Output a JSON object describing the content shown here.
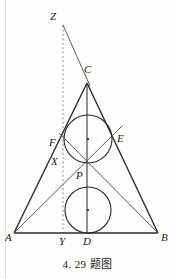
{
  "figure": {
    "caption": "4. 29 题图",
    "width": 175,
    "height": 279,
    "background_color": "#fdfdfb",
    "stroke_color": "#2b2b2b",
    "dashed_color": "#8a8a8a",
    "points": {
      "A": {
        "label": "A",
        "x": 14,
        "y": 233,
        "label_x": 5,
        "label_y": 232
      },
      "B": {
        "label": "B",
        "x": 158,
        "y": 233,
        "label_x": 161,
        "label_y": 232
      },
      "C": {
        "label": "C",
        "x": 87,
        "y": 83,
        "label_x": 84,
        "label_y": 64
      },
      "D": {
        "label": "D",
        "x": 87,
        "y": 233,
        "label_x": 83,
        "label_y": 236
      },
      "E": {
        "label": "E",
        "x": 112,
        "y": 141,
        "label_x": 117,
        "label_y": 133
      },
      "F": {
        "label": "F",
        "x": 65,
        "y": 146,
        "label_x": 49,
        "label_y": 137
      },
      "P": {
        "label": "P",
        "x": 88,
        "y": 174,
        "label_x": 76,
        "label_y": 170
      },
      "X": {
        "label": "X",
        "x": 63,
        "y": 160,
        "label_x": 51,
        "label_y": 156
      },
      "Y": {
        "label": "Y",
        "x": 63,
        "y": 233,
        "label_x": 59,
        "label_y": 236
      },
      "Z": {
        "label": "Z",
        "x": 63,
        "y": 25,
        "label_x": 50,
        "label_y": 11
      }
    },
    "circles": [
      {
        "name": "upper-incircle",
        "cx": 88,
        "cy": 139,
        "r": 24,
        "center_dot": true
      },
      {
        "name": "lower-excircle",
        "cx": 88,
        "cy": 210,
        "r": 23,
        "center_dot": true
      }
    ],
    "segments": [
      {
        "name": "side-AB",
        "from": "A",
        "to": "B"
      },
      {
        "name": "side-AC",
        "from": "A",
        "to": "C"
      },
      {
        "name": "side-BC",
        "from": "B",
        "to": "C"
      },
      {
        "name": "altitude-CD",
        "from": "C",
        "to": "D"
      },
      {
        "name": "cevian-AE",
        "from": "A",
        "to": "E"
      },
      {
        "name": "cevian-BF",
        "from": "B",
        "to": "F"
      },
      {
        "name": "ray-ZC",
        "from": "Z",
        "to": "C"
      }
    ],
    "dashed_segments": [
      {
        "name": "dashed-ZY",
        "from": "Z",
        "to": "Y"
      }
    ]
  }
}
